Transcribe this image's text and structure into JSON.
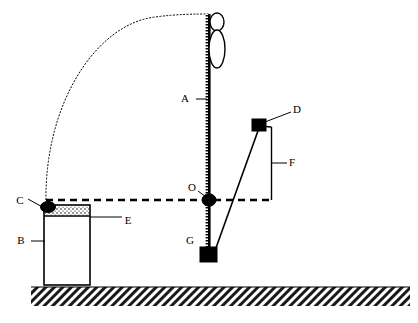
{
  "figure": {
    "type": "mechanics-diagram",
    "title": "",
    "background_color": "#ffffff",
    "ink_color": "#000000",
    "width": 418,
    "height": 323
  },
  "labels": [
    {
      "key": "A",
      "text": "A",
      "x": 189,
      "y": 99,
      "target": "vertical-pole",
      "leader": {
        "x1": 196,
        "y1": 99,
        "x2": 207,
        "y2": 99
      }
    },
    {
      "key": "B",
      "text": "B",
      "x": 24,
      "y": 241,
      "target": "bucket-body",
      "leader": {
        "x1": 31,
        "y1": 241,
        "x2": 45,
        "y2": 241
      }
    },
    {
      "key": "C",
      "text": "C",
      "x": 21,
      "y": 202,
      "target": "pivot-blob-left",
      "leader": {
        "x1": 28,
        "y1": 200,
        "x2": 45,
        "y2": 209
      }
    },
    {
      "key": "D",
      "text": "D",
      "x": 296,
      "y": 110,
      "target": "upper-block",
      "leader": {
        "x1": 292,
        "y1": 112,
        "x2": 266,
        "y2": 123
      }
    },
    {
      "key": "E",
      "text": "E",
      "x": 127,
      "y": 221,
      "target": "bucket-contents",
      "leader": {
        "x1": 123,
        "y1": 217,
        "x2": 90,
        "y2": 217
      }
    },
    {
      "key": "F",
      "text": "F",
      "x": 291,
      "y": 163,
      "target": "vertical-drop-line",
      "leader": {
        "x1": 287,
        "y1": 163,
        "x2": 272,
        "y2": 163
      }
    },
    {
      "key": "G",
      "text": "G",
      "x": 190,
      "y": 241,
      "target": "lower-block",
      "leader": null
    },
    {
      "key": "O",
      "text": "O",
      "x": 192,
      "y": 188,
      "target": "pivot-point",
      "leader": {
        "x1": 198,
        "y1": 191,
        "x2": 206,
        "y2": 198
      }
    }
  ],
  "elements": {
    "pole": {
      "name": "vertical-pole",
      "x": 208.5,
      "y_top": 14,
      "y_bottom": 256,
      "width": 3,
      "hatched_edge": true
    },
    "person": {
      "name": "stick-figure",
      "head": {
        "cx": 217,
        "cy": 22,
        "rx": 7,
        "ry": 9
      },
      "body": {
        "cx": 217,
        "cy": 48,
        "rx": 8,
        "ry": 19
      }
    },
    "trajectory_arc": {
      "name": "projectile-arc",
      "style": "dotted",
      "start": {
        "x": 46,
        "y": 203
      },
      "apex": {
        "x": 150,
        "y": 22
      },
      "end": {
        "x": 208,
        "y": 14
      }
    },
    "dashed_baseline": {
      "name": "horizontal-reference-line",
      "style": "dashed",
      "x1": 46,
      "x2": 272,
      "y": 200
    },
    "bucket": {
      "name": "bucket",
      "x": 44,
      "y": 205,
      "width": 46,
      "height": 80,
      "fill_band": {
        "y": 207,
        "height": 9,
        "pattern": "stipple"
      }
    },
    "pivot_blob": {
      "name": "left-pivot-blob",
      "cx": 48,
      "cy": 207,
      "rx": 7,
      "ry": 5
    },
    "pivot_dot": {
      "name": "pivot-point-dot",
      "cx": 209,
      "cy": 200,
      "rx": 7,
      "ry": 6
    },
    "upper_block": {
      "name": "upper-block",
      "x": 252,
      "y": 119,
      "width": 14,
      "height": 12
    },
    "lower_block": {
      "name": "lower-block",
      "x": 200,
      "y": 247,
      "width": 17,
      "height": 15
    },
    "connector_line": {
      "name": "block-connector-line",
      "x1": 259,
      "y1": 127,
      "x2": 212,
      "y2": 258
    },
    "drop_line": {
      "name": "vertical-drop-line",
      "x": 271.5,
      "y1": 127,
      "y2": 200
    },
    "ground": {
      "name": "ground-hatching",
      "x": 31,
      "y": 287,
      "width": 379,
      "height": 19
    }
  },
  "colors": {
    "ink": "#000000",
    "paper": "#ffffff"
  }
}
